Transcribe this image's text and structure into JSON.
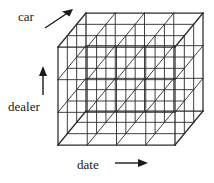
{
  "figure": {
    "kind": "data-cube-diagram",
    "background_color": "#ffffff",
    "line_color": "#2b2b2b",
    "text_color": "#1a1a1a"
  },
  "axes": [
    {
      "id": "car",
      "label": "car",
      "arrow": "diagonal-up-right-arrow",
      "direction": "depth"
    },
    {
      "id": "dealer",
      "label": "dealer",
      "arrow": "up-arrow",
      "direction": "vertical"
    },
    {
      "id": "date",
      "label": "date",
      "arrow": "right-arrow",
      "direction": "horizontal"
    }
  ],
  "cube": {
    "columns": 4,
    "rows": 3,
    "depth": 3,
    "front": {
      "left": 58,
      "top": 47,
      "right": 175,
      "bottom": 145
    },
    "depth_offset": {
      "dx": 28,
      "dy": -34
    }
  }
}
